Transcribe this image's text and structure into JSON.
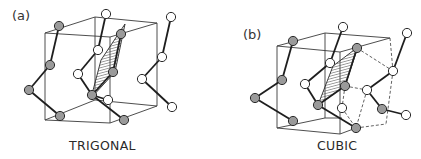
{
  "figure": {
    "panels": [
      {
        "id": "a",
        "label": "(a)",
        "caption": "TRIGONAL",
        "label_pos": [
          12,
          8
        ],
        "caption_pos": [
          69,
          138
        ],
        "box_edges": [
          [
            45,
            33,
            95,
            17
          ],
          [
            95,
            17,
            157,
            23
          ],
          [
            45,
            33,
            110,
            37
          ],
          [
            110,
            37,
            157,
            23
          ],
          [
            45,
            33,
            45,
            120
          ],
          [
            95,
            17,
            95,
            100
          ],
          [
            110,
            37,
            110,
            123
          ],
          [
            157,
            23,
            157,
            106
          ],
          [
            45,
            120,
            110,
            123
          ],
          [
            110,
            123,
            157,
            106
          ],
          [
            45,
            120,
            95,
            100
          ],
          [
            95,
            100,
            157,
            106
          ]
        ],
        "bonds": [
          [
            106,
            14,
            98,
            50
          ],
          [
            98,
            50,
            78,
            74
          ],
          [
            78,
            74,
            92,
            95
          ],
          [
            59,
            26,
            50,
            65
          ],
          [
            50,
            65,
            29,
            90
          ],
          [
            29,
            90,
            60,
            116
          ],
          [
            121,
            34,
            113,
            72
          ],
          [
            113,
            72,
            92,
            95
          ],
          [
            92,
            95,
            124,
            120
          ],
          [
            171,
            17,
            162,
            57
          ],
          [
            162,
            57,
            142,
            79
          ],
          [
            142,
            79,
            172,
            107
          ],
          [
            108,
            100,
            92,
            95
          ]
        ],
        "dashed": [],
        "plane": [
          [
            125,
            24
          ],
          [
            115,
            72
          ],
          [
            91,
            98
          ],
          [
            101,
            60
          ]
        ],
        "atoms_grey": [
          [
            59,
            26
          ],
          [
            121,
            34
          ],
          [
            50,
            65
          ],
          [
            113,
            72
          ],
          [
            29,
            90
          ],
          [
            92,
            95
          ],
          [
            60,
            116
          ],
          [
            124,
            120
          ]
        ],
        "atoms_white": [
          [
            106,
            14
          ],
          [
            171,
            17
          ],
          [
            98,
            50
          ],
          [
            162,
            57
          ],
          [
            78,
            74
          ],
          [
            142,
            79
          ],
          [
            108,
            100
          ],
          [
            172,
            107
          ]
        ]
      },
      {
        "id": "b",
        "label": "(b)",
        "caption": "CUBIC",
        "label_pos": [
          243,
          27
        ],
        "caption_pos": [
          317,
          138
        ],
        "box_edges": [
          [
            277,
            46,
            325,
            33
          ],
          [
            325,
            33,
            390,
            38
          ],
          [
            277,
            46,
            340,
            52
          ],
          [
            340,
            52,
            390,
            38
          ],
          [
            277,
            46,
            277,
            128
          ],
          [
            325,
            33,
            325,
            118
          ],
          [
            340,
            52,
            340,
            134
          ],
          [
            277,
            128,
            340,
            134
          ],
          [
            340,
            134,
            356,
            128
          ],
          [
            277,
            128,
            325,
            118
          ],
          [
            325,
            118,
            342,
            118
          ]
        ],
        "bonds": [
          [
            343,
            27,
            330,
            63
          ],
          [
            330,
            63,
            305,
            84
          ],
          [
            305,
            84,
            318,
            105
          ],
          [
            318,
            105,
            356,
            128
          ],
          [
            293,
            41,
            282,
            80
          ],
          [
            282,
            80,
            255,
            98
          ],
          [
            255,
            98,
            293,
            121
          ],
          [
            357,
            48,
            345,
            86
          ],
          [
            345,
            86,
            318,
            105
          ],
          [
            407,
            33,
            393,
            71
          ],
          [
            393,
            71,
            367,
            90
          ],
          [
            367,
            90,
            382,
            109
          ],
          [
            382,
            109,
            406,
            115
          ]
        ],
        "dashed": [
          [
            357,
            48,
            393,
            71
          ],
          [
            345,
            86,
            367,
            90
          ],
          [
            367,
            90,
            356,
            128
          ],
          [
            393,
            71,
            386,
            124
          ],
          [
            356,
            128,
            386,
            124
          ],
          [
            345,
            86,
            342,
            108
          ],
          [
            342,
            108,
            356,
            128
          ],
          [
            390,
            38,
            393,
            71
          ]
        ],
        "plane": [
          [
            358,
            47
          ],
          [
            345,
            86
          ],
          [
            318,
            105
          ],
          [
            333,
            66
          ]
        ],
        "atoms_grey": [
          [
            293,
            41
          ],
          [
            282,
            80
          ],
          [
            255,
            98
          ],
          [
            293,
            121
          ],
          [
            357,
            48
          ],
          [
            345,
            86
          ],
          [
            318,
            105
          ],
          [
            382,
            109
          ],
          [
            356,
            128
          ]
        ],
        "atoms_white": [
          [
            343,
            27
          ],
          [
            407,
            33
          ],
          [
            330,
            63
          ],
          [
            305,
            84
          ],
          [
            393,
            71
          ],
          [
            367,
            90
          ],
          [
            342,
            108
          ],
          [
            406,
            115
          ]
        ]
      }
    ]
  },
  "colors": {
    "line": "#3a3a3a",
    "bond": "#1e1e1e",
    "atom_grey": "#9a9a9a",
    "atom_white": "#ffffff",
    "atom_stroke": "#2a2a2a",
    "hatch": "#555555"
  }
}
